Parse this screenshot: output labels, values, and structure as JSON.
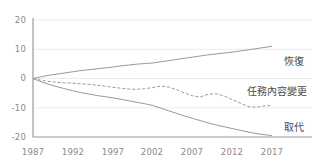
{
  "chart_data": {
    "type": "line",
    "title": "",
    "xlabel": "",
    "ylabel": "",
    "xlim": [
      1987,
      2017
    ],
    "ylim": [
      -20,
      20
    ],
    "xticks": [
      1987,
      1992,
      1997,
      2002,
      2007,
      2012,
      2017
    ],
    "yticks": [
      20,
      10,
      0,
      -10,
      -20
    ],
    "grid": true,
    "legend_position": "right-inline",
    "series": [
      {
        "name": "恢復",
        "style": "solid",
        "color": "#8c8c8c",
        "label_value": 11,
        "x": [
          1987,
          1988,
          1989,
          1990,
          1991,
          1992,
          1993,
          1994,
          1995,
          1996,
          1997,
          1998,
          1999,
          2000,
          2001,
          2002,
          2003,
          2004,
          2005,
          2006,
          2007,
          2008,
          2009,
          2010,
          2011,
          2012,
          2013,
          2014,
          2015,
          2016,
          2017
        ],
        "values": [
          0,
          0.6,
          1.1,
          1.5,
          1.9,
          2.3,
          2.7,
          3.0,
          3.3,
          3.6,
          3.9,
          4.3,
          4.6,
          4.9,
          5.1,
          5.3,
          5.7,
          6.1,
          6.5,
          6.9,
          7.3,
          7.7,
          8.1,
          8.4,
          8.7,
          9.0,
          9.4,
          9.8,
          10.2,
          10.6,
          11.0
        ]
      },
      {
        "name": "任務內容變更",
        "style": "dashed",
        "color": "#8c8c8c",
        "label_value": -9,
        "x": [
          1987,
          1988,
          1989,
          1990,
          1991,
          1992,
          1993,
          1994,
          1995,
          1996,
          1997,
          1998,
          1999,
          2000,
          2001,
          2002,
          2003,
          2004,
          2005,
          2006,
          2007,
          2008,
          2009,
          2010,
          2011,
          2012,
          2013,
          2014,
          2015,
          2016,
          2017
        ],
        "values": [
          0,
          -0.6,
          -1.0,
          -1.3,
          -1.5,
          -1.6,
          -1.8,
          -2.0,
          -2.3,
          -2.6,
          -3.0,
          -3.3,
          -3.6,
          -3.7,
          -3.5,
          -3.1,
          -2.6,
          -2.9,
          -3.8,
          -4.9,
          -5.9,
          -6.3,
          -5.4,
          -5.2,
          -6.0,
          -7.2,
          -8.4,
          -9.6,
          -9.8,
          -9.4,
          -9.2
        ]
      },
      {
        "name": "取代",
        "style": "solid",
        "color": "#8c8c8c",
        "label_value": -19.5,
        "x": [
          1987,
          1988,
          1989,
          1990,
          1991,
          1992,
          1993,
          1994,
          1995,
          1996,
          1997,
          1998,
          1999,
          2000,
          2001,
          2002,
          2003,
          2004,
          2005,
          2006,
          2007,
          2008,
          2009,
          2010,
          2011,
          2012,
          2013,
          2014,
          2015,
          2016,
          2017
        ],
        "values": [
          0,
          -1.1,
          -2.0,
          -2.8,
          -3.5,
          -4.2,
          -4.8,
          -5.3,
          -5.8,
          -6.2,
          -6.6,
          -7.1,
          -7.6,
          -8.1,
          -8.6,
          -9.2,
          -10.1,
          -11.0,
          -11.9,
          -12.8,
          -13.6,
          -14.4,
          -15.2,
          -15.9,
          -16.5,
          -17.1,
          -17.7,
          -18.3,
          -18.8,
          -19.2,
          -19.5
        ]
      }
    ]
  },
  "axes": {
    "y_labels": [
      "20",
      "10",
      "0",
      "-10",
      "-20"
    ],
    "x_labels": [
      "1987",
      "1992",
      "1997",
      "2002",
      "2007",
      "2012",
      "2017"
    ]
  },
  "labels": {
    "recovery": "恢復",
    "task_change": "任務內容變更",
    "replacement": "取代"
  },
  "colors": {
    "line": "#8c8c8c",
    "axis": "#9a9a9a",
    "grid": "#ececec",
    "tick_text": "#8a8a8a",
    "label_text": "#4a4a4a",
    "background": "#ffffff"
  }
}
